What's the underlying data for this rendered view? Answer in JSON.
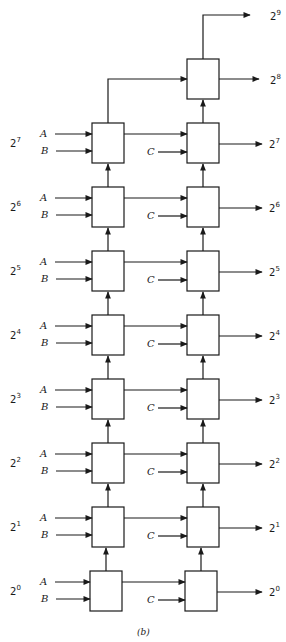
{
  "figure": {
    "caption": "(b)",
    "row_base": "2",
    "rows": [
      {
        "exp": "7",
        "in_a": "A",
        "in_b": "B",
        "in_c": "C",
        "out_exp": "7"
      },
      {
        "exp": "6",
        "in_a": "A",
        "in_b": "B",
        "in_c": "C",
        "out_exp": "6"
      },
      {
        "exp": "5",
        "in_a": "A",
        "in_b": "B",
        "in_c": "C",
        "out_exp": "5"
      },
      {
        "exp": "4",
        "in_a": "A",
        "in_b": "B",
        "in_c": "C",
        "out_exp": "4"
      },
      {
        "exp": "3",
        "in_a": "A",
        "in_b": "B",
        "in_c": "C",
        "out_exp": "3"
      },
      {
        "exp": "2",
        "in_a": "A",
        "in_b": "B",
        "in_c": "C",
        "out_exp": "2"
      },
      {
        "exp": "1",
        "in_a": "A",
        "in_b": "B",
        "in_c": "C",
        "out_exp": "1"
      },
      {
        "exp": "0",
        "in_a": "A",
        "in_b": "B",
        "in_c": "C",
        "out_exp": "0"
      }
    ],
    "top_outputs": [
      {
        "exp": "9"
      },
      {
        "exp": "8"
      }
    ],
    "colors": {
      "stroke": "#1a1a1a",
      "background": "#ffffff"
    }
  }
}
